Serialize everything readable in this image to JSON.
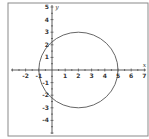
{
  "chart_data": {
    "type": "line",
    "title": "",
    "xlabel": "x",
    "ylabel": "y",
    "xlim": [
      -3.1,
      7
    ],
    "ylim": [
      -5,
      5
    ],
    "grid": false,
    "legend": null,
    "x_ticks": [
      -2,
      -1,
      1,
      2,
      3,
      4,
      5,
      6,
      7
    ],
    "x_tick_labels": [
      "-2",
      "-1",
      "1",
      "2",
      "3",
      "4",
      "5",
      "6",
      "7"
    ],
    "y_ticks": [
      5,
      4,
      3,
      2,
      1,
      -1,
      -2,
      -3,
      -4
    ],
    "y_tick_labels": [
      "5",
      "4",
      "3",
      "2",
      "1",
      "-1",
      "-2",
      "-3",
      "-4"
    ],
    "series": [
      {
        "name": "circle",
        "shape": "circle",
        "center": [
          2,
          0
        ],
        "radius": 3,
        "key_points": [
          [
            5,
            0
          ],
          [
            -1,
            0
          ],
          [
            2,
            3
          ],
          [
            2,
            -3
          ],
          [
            0,
            2.236
          ],
          [
            0,
            -2.236
          ]
        ]
      }
    ]
  },
  "colors": {
    "frame": "#8a8a8a",
    "axis": "#333333",
    "curve": "#555555",
    "background": "#ffffff"
  }
}
